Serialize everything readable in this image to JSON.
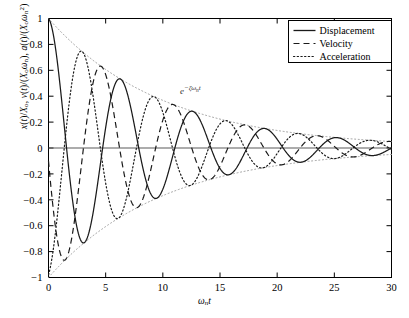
{
  "chart_data": {
    "type": "line",
    "title": "",
    "xlabel": "ωₙt",
    "ylabel": "x(t)/Xₒ, v(t)/(Xₒωₙ), a(t)/(Xₒωₙ²)",
    "xlim": [
      0,
      30
    ],
    "ylim": [
      -1,
      1
    ],
    "xticks": [
      0,
      5,
      10,
      15,
      20,
      25,
      30
    ],
    "yticks": [
      -1,
      -0.8,
      -0.6,
      -0.4,
      -0.2,
      0,
      0.2,
      0.4,
      0.6,
      0.8,
      1
    ],
    "xtick_labels": [
      "0",
      "5",
      "10",
      "15",
      "20",
      "25",
      "30"
    ],
    "ytick_labels": [
      "−1",
      "−0.8",
      "−0.6",
      "−0.4",
      "−0.2",
      "0",
      "0.2",
      "0.4",
      "0.6",
      "0.8",
      "1"
    ],
    "grid": false,
    "legend_position": "top-right",
    "annotations": [
      {
        "text": "e⁻ζωₙt",
        "x": 11.5,
        "y": 0.42,
        "note": "exponential decay envelope label"
      }
    ],
    "damping_ratio": 0.1,
    "natural_frequency": 1.0,
    "damped_frequency": 0.995,
    "envelope": {
      "style": "dotted",
      "upper": "+e^(-0.1 x)",
      "lower": "-e^(-0.1 x)"
    },
    "series": [
      {
        "name": "Displacement",
        "style": "solid",
        "color": "#1a1a1a",
        "formula": "e^(-0.1 t) * cos(0.995 t)",
        "x": [
          0,
          1,
          2,
          3,
          4,
          5,
          6,
          7,
          8,
          9,
          10,
          11,
          12,
          13,
          14,
          15,
          16,
          17,
          18,
          19,
          20,
          21,
          22,
          23,
          24,
          25,
          26,
          27,
          28,
          29,
          30
        ],
        "y": [
          1.0,
          0.493,
          -0.363,
          -0.734,
          -0.436,
          0.172,
          0.529,
          0.373,
          -0.064,
          -0.368,
          -0.304,
          -0.004,
          0.243,
          0.239,
          0.048,
          -0.152,
          -0.181,
          -0.064,
          0.088,
          0.131,
          0.065,
          -0.044,
          -0.092,
          -0.058,
          0.017,
          0.062,
          0.048,
          -0.002,
          -0.04,
          -0.037,
          -0.006
        ]
      },
      {
        "name": "Velocity",
        "style": "dashed",
        "color": "#1a1a1a",
        "formula": "-e^(-0.1 t) * sin(0.995 t) (normalized)",
        "x": [
          0,
          1,
          2,
          3,
          4,
          5,
          6,
          7,
          8,
          9,
          10,
          11,
          12,
          13,
          14,
          15,
          16,
          17,
          18,
          19,
          20,
          21,
          22,
          23,
          24,
          25,
          26,
          27,
          28,
          29,
          30
        ],
        "y": [
          0.0,
          -0.762,
          -0.744,
          -0.104,
          0.512,
          0.585,
          0.185,
          -0.283,
          -0.415,
          -0.201,
          0.126,
          0.286,
          0.179,
          -0.039,
          -0.186,
          -0.155,
          -0.005,
          0.112,
          0.122,
          0.035,
          -0.062,
          -0.092,
          -0.041,
          0.028,
          0.065,
          0.04,
          -0.01,
          -0.042,
          -0.033,
          0.0,
          0.026
        ]
      },
      {
        "name": "Acceleration",
        "style": "dotted",
        "color": "#1a1a1a",
        "formula": "-e^(-0.1 t) * cos(0.995 t + 2φ) (normalized)",
        "x": [
          0,
          1,
          2,
          3,
          4,
          5,
          6,
          7,
          8,
          9,
          10,
          11,
          12,
          13,
          14,
          15,
          16,
          17,
          18,
          19,
          20,
          21,
          22,
          23,
          24,
          25,
          26,
          27,
          28,
          29,
          30
        ],
        "y": [
          -1.0,
          -0.34,
          0.513,
          0.742,
          0.333,
          -0.285,
          -0.55,
          -0.306,
          0.15,
          0.4,
          0.275,
          -0.059,
          -0.266,
          -0.219,
          -0.011,
          0.169,
          0.171,
          0.036,
          -0.106,
          -0.131,
          -0.05,
          0.058,
          0.093,
          0.047,
          -0.027,
          -0.064,
          -0.041,
          0.011,
          0.042,
          0.032,
          0.0
        ]
      }
    ],
    "legend": [
      {
        "label": "Displacement",
        "style": "solid"
      },
      {
        "label": "Velocity",
        "style": "dashed"
      },
      {
        "label": "Acceleration",
        "style": "dotted"
      }
    ]
  },
  "colors": {
    "axis": "#000000",
    "curve": "#1a1a1a",
    "envelope": "#9a9a9a",
    "background": "#ffffff"
  }
}
